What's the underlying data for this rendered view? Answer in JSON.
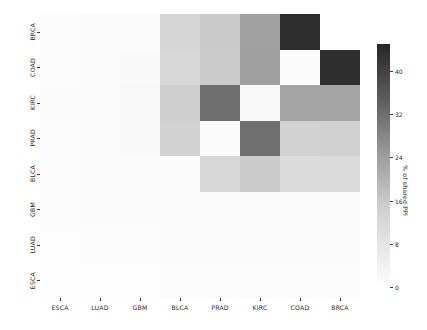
{
  "figure": {
    "background": "#ffffff",
    "width": 427,
    "height": 330
  },
  "colorbar": {
    "label": "% of shared PPI",
    "ticks": [
      "0",
      "8",
      "16",
      "24",
      "32",
      "40"
    ],
    "tick_values": [
      0,
      8,
      16,
      24,
      32,
      40
    ],
    "vmin": 0,
    "vmax": 45,
    "low_color": "#ffffff",
    "high_color": "#262626"
  },
  "chart_data": {
    "type": "heatmap",
    "title": "",
    "xlabel": "",
    "ylabel": "",
    "colorbar_label": "% of shared PPI",
    "x_tick_labels": [
      "ESCA",
      "LUAD",
      "GBM",
      "BLCA",
      "PRAD",
      "KIRC",
      "COAD",
      "BRCA"
    ],
    "y_tick_labels": [
      "BRCA",
      "COAD",
      "KIRC",
      "PRAD",
      "BLCA",
      "GBM",
      "LUAD",
      "ESCA"
    ],
    "x_categories": [
      "ESCA",
      "LUAD",
      "GBM",
      "BLCA",
      "PRAD",
      "KIRC",
      "COAD",
      "BRCA"
    ],
    "y_categories_top_to_bottom": [
      "BRCA",
      "COAD",
      "KIRC",
      "PRAD",
      "BLCA",
      "GBM",
      "LUAD",
      "ESCA"
    ],
    "vmin": 0,
    "vmax": 45,
    "cmap": "Greys",
    "grid": false,
    "legend": "colorbar-right",
    "values": [
      [
        0.4,
        0.6,
        1.0,
        11.5,
        13.5,
        20.5,
        44.0,
        0.0
      ],
      [
        0.5,
        0.7,
        1.1,
        11.0,
        13.0,
        21.0,
        2.5,
        43.5
      ],
      [
        0.6,
        0.9,
        1.4,
        12.5,
        28.0,
        3.0,
        19.5,
        19.5
      ],
      [
        0.5,
        0.8,
        1.2,
        12.0,
        2.0,
        27.5,
        12.0,
        12.5
      ],
      [
        0.4,
        0.7,
        1.0,
        1.5,
        11.0,
        14.0,
        10.5,
        10.5
      ],
      [
        0.4,
        0.6,
        0.9,
        1.2,
        1.1,
        1.3,
        1.0,
        1.1
      ],
      [
        0.3,
        0.4,
        0.5,
        0.6,
        0.6,
        0.7,
        0.6,
        0.6
      ],
      [
        0.2,
        0.3,
        0.3,
        0.4,
        0.4,
        0.4,
        0.4,
        0.4
      ]
    ],
    "cell_colors": [
      [
        "#fcfcfc",
        "#fbfbfb",
        "#fafafa",
        "#d5d5d5",
        "#c9c9c9",
        "#a1a1a1",
        "#2d2d2d",
        "#ffffff"
      ],
      [
        "#fcfcfc",
        "#fbfbfb",
        "#f9f9f9",
        "#d7d7d7",
        "#cbcbcb",
        "#9f9f9f",
        "#fafafa",
        "#2e2e2e"
      ],
      [
        "#fbfbfb",
        "#fafafa",
        "#f8f8f8",
        "#cfcfcf",
        "#6e6e6e",
        "#f8f8f8",
        "#a4a4a4",
        "#a4a4a4"
      ],
      [
        "#fcfcfc",
        "#fafafa",
        "#f9f9f9",
        "#d2d2d2",
        "#fafafa",
        "#707070",
        "#d2d2d2",
        "#d0d0d0"
      ],
      [
        "#fcfcfc",
        "#fbfbfb",
        "#fafafa",
        "#fbfbfb",
        "#d8d8d8",
        "#cccccc",
        "#dbdbdb",
        "#dbdbdb"
      ],
      [
        "#fcfcfc",
        "#fbfbfb",
        "#fafafa",
        "#fafafa",
        "#fafafa",
        "#fafafa",
        "#fafafa",
        "#fafafa"
      ],
      [
        "#fdfdfd",
        "#fcfcfc",
        "#fcfcfc",
        "#fbfbfb",
        "#fbfbfb",
        "#fbfbfb",
        "#fbfbfb",
        "#fbfbfb"
      ],
      [
        "#fdfdfd",
        "#fdfdfd",
        "#fdfdfd",
        "#fcfcfc",
        "#fcfcfc",
        "#fcfcfc",
        "#fcfcfc",
        "#fcfcfc"
      ]
    ]
  }
}
